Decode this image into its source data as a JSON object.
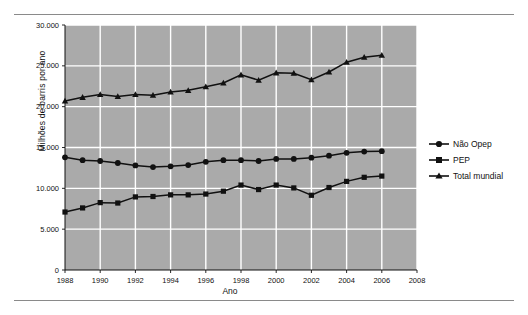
{
  "axis": {
    "ylabel": "Milhões de barris por ano",
    "xlabel": "Ano",
    "yticks": [
      "0",
      "5.000",
      "10.000",
      "15.000",
      "20.000",
      "25.000",
      "30.000"
    ],
    "xticks": [
      "1988",
      "1990",
      "1992",
      "1994",
      "1996",
      "1998",
      "2000",
      "2002",
      "2004",
      "2006",
      "2008"
    ]
  },
  "legend": {
    "items": [
      {
        "label": "Não Opep",
        "marker": "circle"
      },
      {
        "label": "PEP",
        "marker": "square"
      },
      {
        "label": "Total mundial",
        "marker": "triangle"
      }
    ]
  },
  "colors": {
    "plot_background": "#aaaaaa",
    "gridline": "#ffffff",
    "series_line": "#111111",
    "page_background": "#ffffff",
    "rule": "#8a8a8a"
  },
  "chart_data": {
    "type": "line",
    "title": "",
    "xlabel": "Ano",
    "ylabel": "Milhões de barris por ano",
    "xlim": [
      1988,
      2008
    ],
    "ylim": [
      0,
      30000
    ],
    "ytick_step": 5000,
    "xtick_step": 2,
    "grid": true,
    "legend_position": "right",
    "x": [
      1988,
      1989,
      1990,
      1991,
      1992,
      1993,
      1994,
      1995,
      1996,
      1997,
      1998,
      1999,
      2000,
      2001,
      2002,
      2003,
      2004,
      2005,
      2006
    ],
    "series": [
      {
        "name": "Não Opep",
        "marker": "circle",
        "values": [
          13800,
          13450,
          13350,
          13100,
          12800,
          12600,
          12700,
          12850,
          13250,
          13450,
          13450,
          13350,
          13600,
          13600,
          13750,
          14000,
          14350,
          14500,
          14550
        ]
      },
      {
        "name": "PEP",
        "marker": "square",
        "values": [
          7100,
          7600,
          8250,
          8200,
          8950,
          9000,
          9200,
          9200,
          9300,
          9650,
          10400,
          9850,
          10400,
          10050,
          9150,
          10100,
          10850,
          11350,
          11500
        ]
      },
      {
        "name": "Total mundial",
        "marker": "triangle",
        "values": [
          20700,
          21150,
          21500,
          21250,
          21500,
          21400,
          21800,
          22000,
          22450,
          22900,
          23900,
          23250,
          24150,
          24100,
          23300,
          24250,
          25450,
          26050,
          26300
        ]
      }
    ]
  }
}
